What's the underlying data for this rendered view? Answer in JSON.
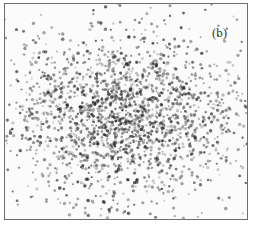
{
  "panel": {
    "label": "(b)"
  },
  "chart_data": {
    "type": "scatter",
    "title": "",
    "panel_label": "(b)",
    "xlabel": "",
    "ylabel": "",
    "axes_visible": false,
    "grid": false,
    "legend": null,
    "cluster": {
      "center_x_frac": 0.45,
      "center_y_frac": 0.52,
      "sigma_x_frac": 0.22,
      "sigma_y_frac": 0.18,
      "secondary_center_x_frac": 0.55,
      "secondary_center_y_frac": 0.5,
      "point_count_estimate": 3000
    },
    "colors": {
      "points": "#1a1a1a",
      "border": "#6e6e6e",
      "background": "#fbfbfb"
    }
  }
}
